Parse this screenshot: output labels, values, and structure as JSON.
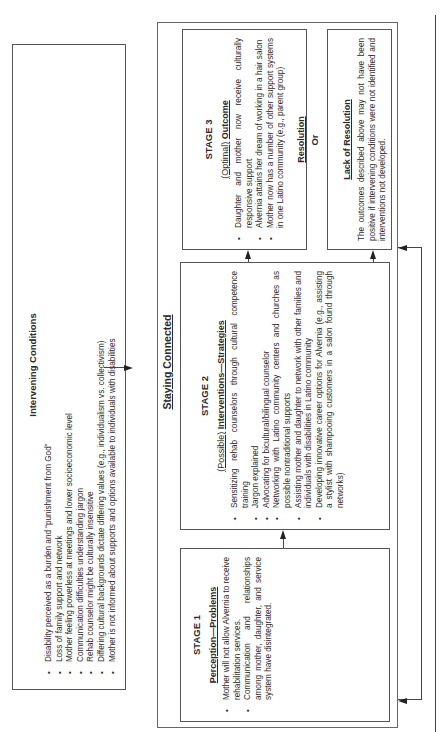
{
  "intervening": {
    "title": "Intervening Conditions",
    "items": [
      "Disability perceived as a burden and “punishment from God”",
      "Loss of family support and network",
      "Mother feeling powerless at meetings and lower socioeconomic level",
      "Communication difficulties understanding jargon",
      "Rehab counselor might be culturally insensitive",
      "Differing cultural backgrounds dictate differing values (e.g., individualism vs. collectivism)",
      "Mother is not informed about supports and options available to individuals with disabilities"
    ]
  },
  "staying_connected": {
    "title": "Staying Connected"
  },
  "stage1": {
    "title": "STAGE 1",
    "subtitle": "Perception—Problems",
    "items": [
      "Mother will not allow Alvernia to receive rehabilitation services.",
      "Communication and relationships among mother, daughter, and service system have disintegrated."
    ]
  },
  "stage2": {
    "title": "STAGE 2",
    "subtitle_prefix": "(Possible)",
    "subtitle_main": "Interventions—Strategies",
    "items": [
      "Sensitizing rehab counselors through cultural competence training",
      "Jargon explained",
      "Advocating for bicultural/bilingual counselor",
      "Networking with Latino community centers and churches as possible nontraditional supports",
      "Assisting mother and daughter to network with other families and individuals with disabilities in Latino community",
      "Developing innovative career options for Alvernia (e.g., assisting a stylist with shampooing customers in a salon found through networks)"
    ]
  },
  "stage3": {
    "title": "STAGE 3",
    "subtitle_prefix": "(Optimal)",
    "subtitle_main": "Outcome",
    "items": [
      "Daughter and mother now receive culturally responsive support",
      "Alvernia attains her dream of working in a hair salon",
      "Mother now has a number of other support systems in one Latino community (e.g., parent group)"
    ],
    "resolution_label": "Resolution",
    "or_label": "Or"
  },
  "lack_of_resolution": {
    "title": "Lack of Resolution",
    "text": "The outcomes described above may not have been positive if intervening conditions were not identified and interventions not developed."
  }
}
